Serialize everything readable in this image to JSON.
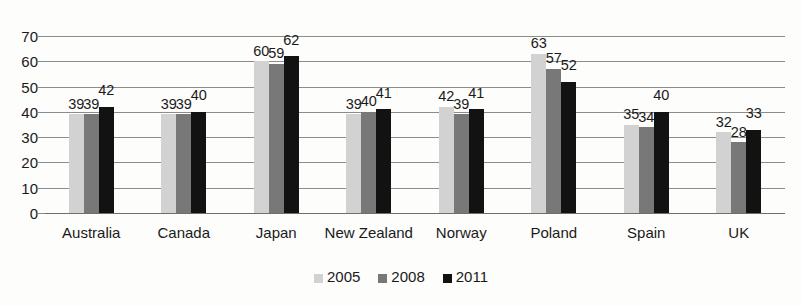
{
  "chart_data": {
    "type": "bar",
    "title": "",
    "xlabel": "",
    "ylabel": "",
    "ylim": [
      0,
      70
    ],
    "ytick_step": 10,
    "yticks": [
      "70",
      "60",
      "50",
      "40",
      "30",
      "20",
      "10",
      "0"
    ],
    "grid": true,
    "legend_position": "bottom-center",
    "categories": [
      "Australia",
      "Canada",
      "Japan",
      "New Zealand",
      "Norway",
      "Poland",
      "Spain",
      "UK"
    ],
    "series": [
      {
        "name": "2005",
        "color": "#d2d2d2",
        "values": [
          39,
          39,
          60,
          39,
          42,
          63,
          35,
          32
        ]
      },
      {
        "name": "2008",
        "color": "#787878",
        "values": [
          39,
          39,
          59,
          40,
          39,
          57,
          34,
          28
        ]
      },
      {
        "name": "2011",
        "color": "#121212",
        "values": [
          42,
          40,
          62,
          41,
          41,
          52,
          40,
          33
        ]
      }
    ],
    "data_labels": [
      [
        "39",
        "39",
        "42"
      ],
      [
        "39",
        "39",
        "40"
      ],
      [
        "60",
        "59",
        "62"
      ],
      [
        "39",
        "40",
        "41"
      ],
      [
        "42",
        "39",
        "41"
      ],
      [
        "63",
        "57",
        "52"
      ],
      [
        "35",
        "34",
        "40"
      ],
      [
        "32",
        "28",
        "33"
      ]
    ]
  },
  "legend": {
    "items": [
      {
        "label": "2005",
        "color": "#d2d2d2"
      },
      {
        "label": "2008",
        "color": "#787878"
      },
      {
        "label": "2011",
        "color": "#121212"
      }
    ]
  },
  "title_remnant": "clipped heading"
}
